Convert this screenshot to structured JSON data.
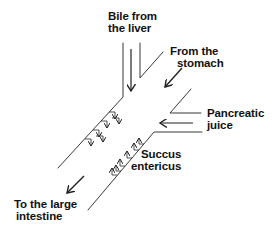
{
  "diagram": {
    "colors": {
      "line": "#222222",
      "background": "#ffffff",
      "text": "#111111"
    },
    "labels": {
      "bile": {
        "line1": "Bile from",
        "line2": "the liver"
      },
      "stomach": {
        "line1": "From the",
        "line2": "stomach"
      },
      "pancreatic": {
        "line1": "Pancreatic",
        "line2": "juice"
      },
      "succus": {
        "line1": "Succus",
        "line2": "entericus"
      },
      "large_intestine": {
        "line1": "To the large",
        "line2": "intestine"
      }
    },
    "arrows": [
      {
        "name": "bile-flow-arrow",
        "direction": "down"
      },
      {
        "name": "stomach-flow-arrow",
        "direction": "down-left"
      },
      {
        "name": "pancreatic-flow-arrow",
        "direction": "left"
      },
      {
        "name": "exit-flow-arrow",
        "direction": "down-left"
      },
      {
        "name": "wall-secretion-arrows-upper",
        "count": 6,
        "direction": "into-lumen"
      },
      {
        "name": "wall-secretion-arrows-lower",
        "count": 6,
        "direction": "into-lumen"
      }
    ]
  }
}
